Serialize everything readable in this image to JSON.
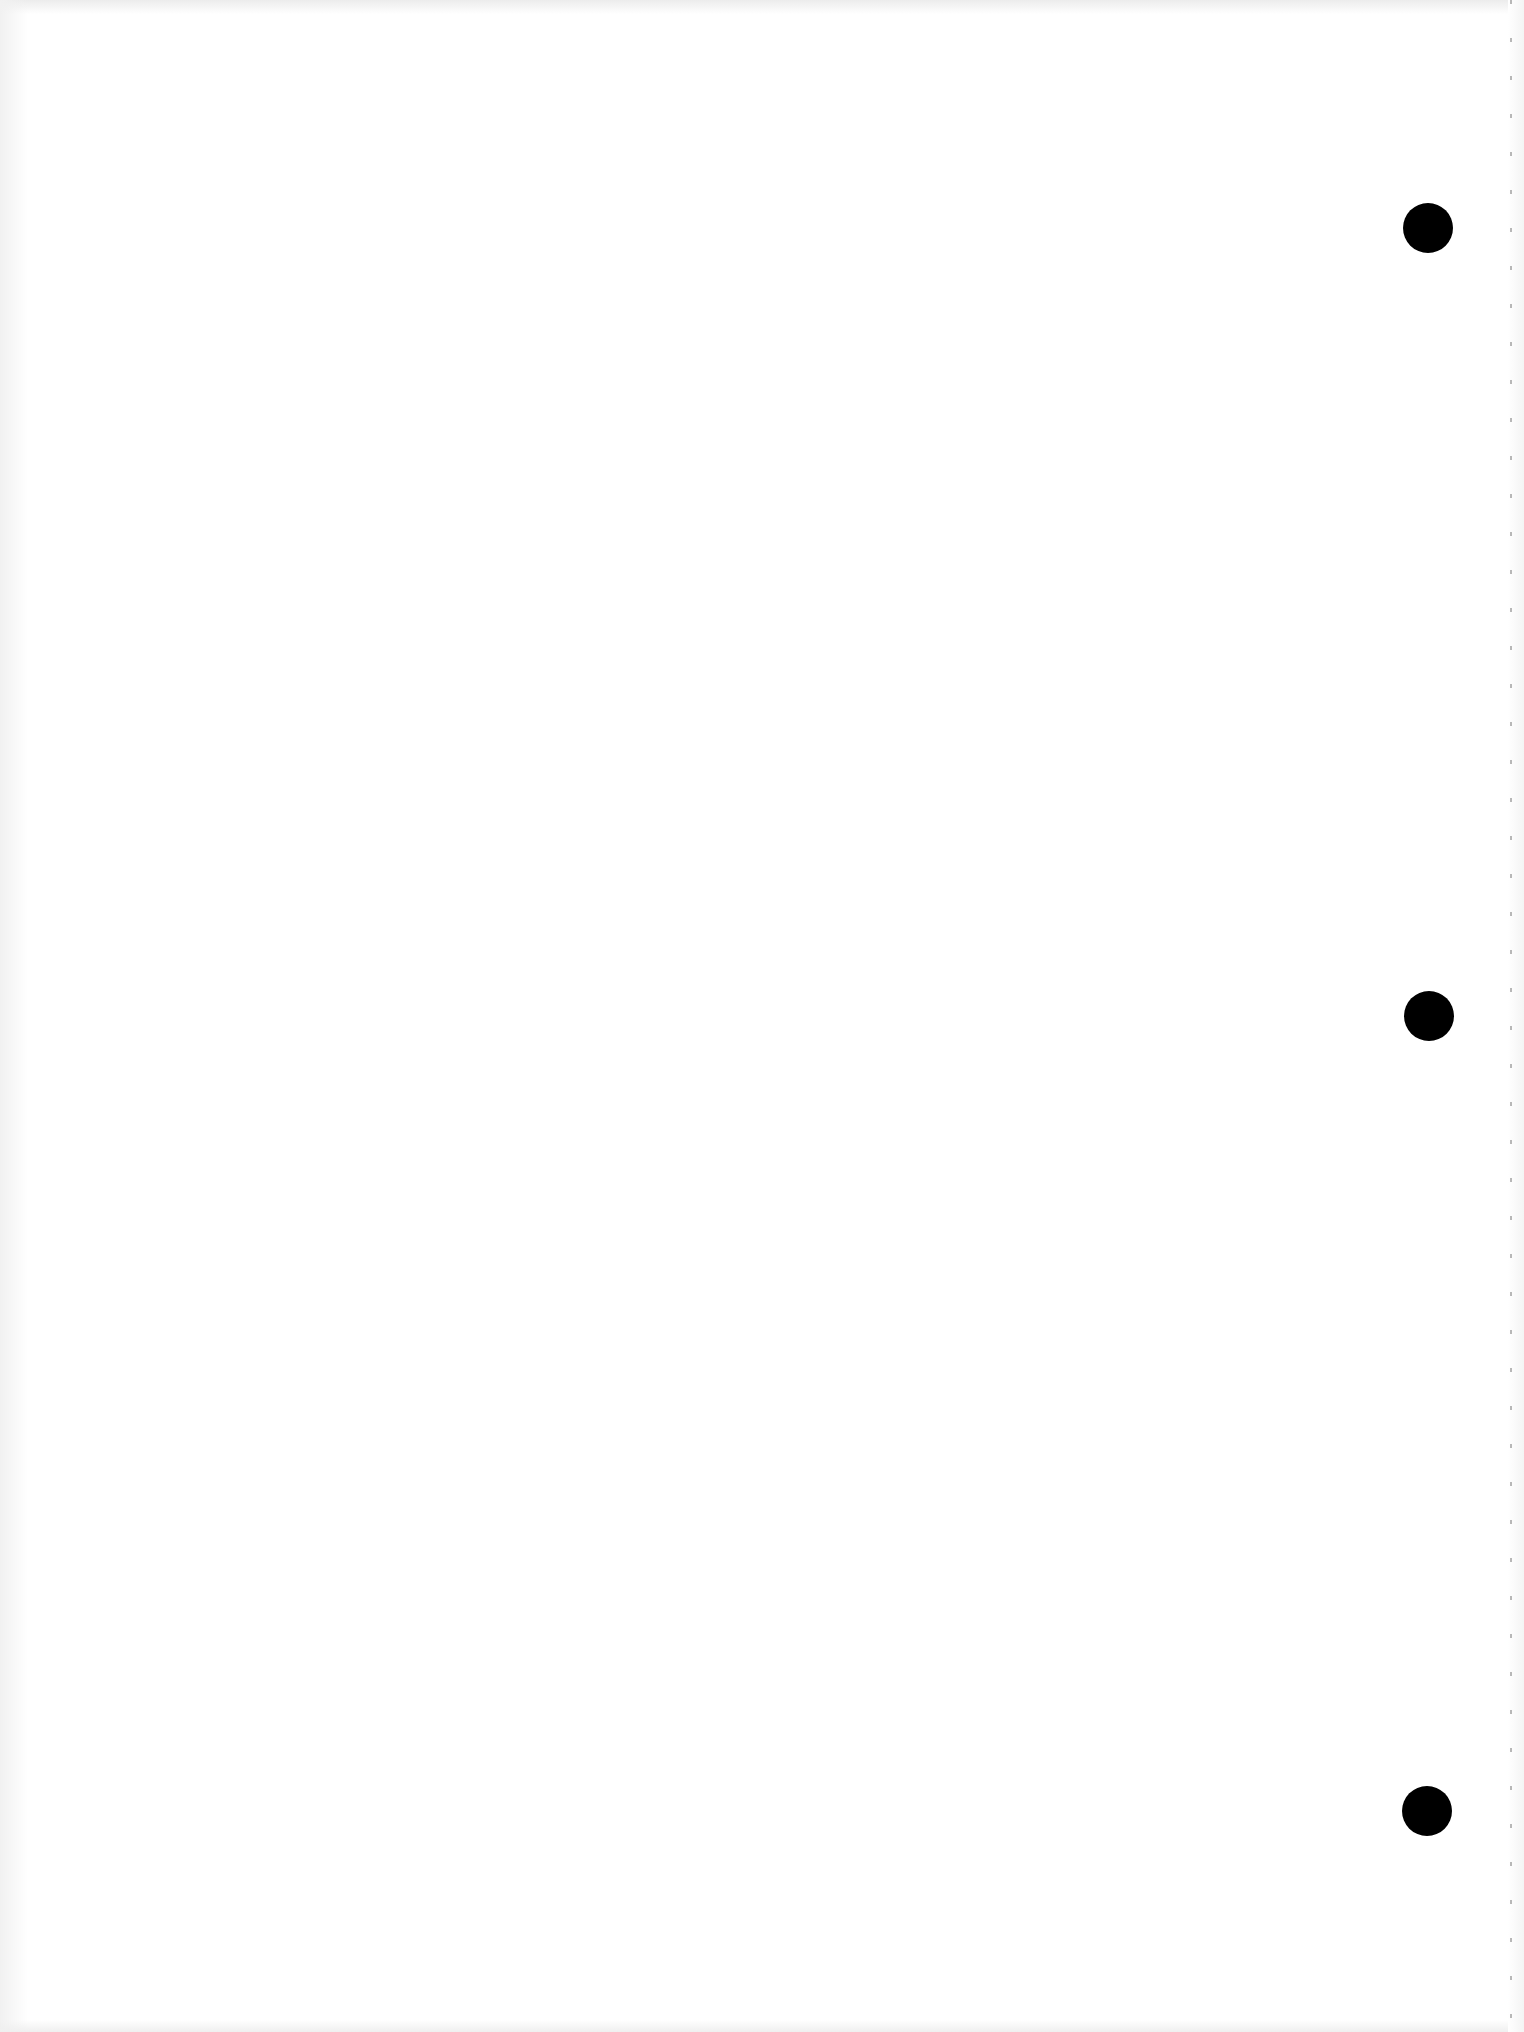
{
  "document": {
    "type": "blank loose-leaf sheet",
    "text_content": "",
    "background_color": "#ffffff"
  },
  "punch_holes": [
    {
      "name": "top",
      "center_x": 1428,
      "center_y": 228,
      "diameter": 50,
      "color": "#000000"
    },
    {
      "name": "middle",
      "center_x": 1429,
      "center_y": 1016,
      "diameter": 50,
      "color": "#000000"
    },
    {
      "name": "bottom",
      "center_x": 1427,
      "center_y": 1811,
      "diameter": 50,
      "color": "#000000"
    }
  ],
  "perforated_edge": {
    "side": "right",
    "x": 1510,
    "color": "#9a9a9a"
  }
}
